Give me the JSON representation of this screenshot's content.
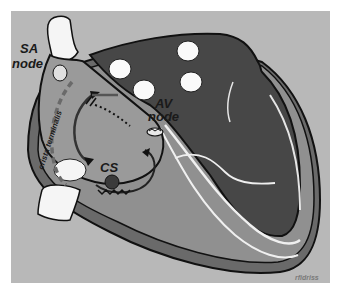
{
  "figure": {
    "labels": {
      "sa_node_line1": "SA",
      "sa_node_line2": "node",
      "av_node_line1": "AV",
      "av_node_line2": "node",
      "crista_terminalis": "crista terminalis",
      "coronary_sinus": "CS",
      "credit": "rfidriss"
    },
    "colors": {
      "background": "#b8b8b8",
      "frame_border": "#ffffff",
      "right_atrium": "#9a9a9a",
      "left_chambers": "#4a4a4a",
      "wall_mid": "#7c7c7c",
      "vessel": "#f2f2f2",
      "outline": "#111111",
      "text": "#1a1a1a"
    }
  }
}
